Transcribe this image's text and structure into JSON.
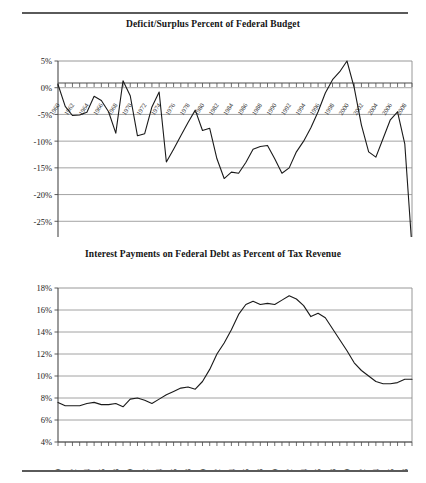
{
  "page": {
    "has_top_rule": true,
    "has_bottom_rule": true,
    "rule_color": "#5a5a5a"
  },
  "chart_data": [
    {
      "id": "deficit-surplus",
      "type": "line",
      "title": "Deficit/Surplus Percent of Federal Budget",
      "xlabel": "",
      "ylabel": "",
      "grid": true,
      "legend": "none",
      "line_color": "#1a1a1a",
      "xlim": [
        1960,
        2009
      ],
      "ylim": [
        -30,
        5
      ],
      "yticks": [
        5,
        0,
        -5,
        -10,
        -15,
        -20,
        -25,
        -30
      ],
      "ytick_labels": [
        "5%",
        "0%",
        "-5%",
        "-10%",
        "-15%",
        "-20%",
        "-25%",
        "-30%"
      ],
      "xticks": [
        1960,
        1962,
        1964,
        1966,
        1968,
        1970,
        1972,
        1974,
        1976,
        1978,
        1980,
        1982,
        1984,
        1986,
        1988,
        1990,
        1992,
        1994,
        1996,
        1998,
        2000,
        2002,
        2004,
        2006,
        2008
      ],
      "xtick_labels": [
        "1960",
        "1962",
        "1964",
        "1966",
        "1968",
        "1970",
        "1972",
        "1974",
        "1976",
        "1978",
        "1980",
        "1982",
        "1984",
        "1986",
        "1988",
        "1990",
        "1992",
        "1994",
        "1996",
        "1998",
        "2000",
        "2002",
        "2004",
        "2006",
        "2008"
      ],
      "x": [
        1960,
        1961,
        1962,
        1963,
        1964,
        1965,
        1966,
        1967,
        1968,
        1969,
        1970,
        1971,
        1972,
        1973,
        1974,
        1975,
        1976,
        1977,
        1978,
        1979,
        1980,
        1981,
        1982,
        1983,
        1984,
        1985,
        1986,
        1987,
        1988,
        1989,
        1990,
        1991,
        1992,
        1993,
        1994,
        1995,
        1996,
        1997,
        1998,
        1999,
        2000,
        2001,
        2002,
        2003,
        2004,
        2005,
        2006,
        2007,
        2008,
        2009
      ],
      "values": [
        0.6,
        -3.5,
        -5.2,
        -5.1,
        -4.6,
        -1.6,
        -2.4,
        -4.5,
        -8.5,
        1.3,
        -1.5,
        -9.0,
        -8.6,
        -3.6,
        -0.8,
        -13.9,
        -11.5,
        -9.0,
        -6.5,
        -4.2,
        -8.0,
        -7.6,
        -13.3,
        -17.0,
        -15.8,
        -16.0,
        -14.0,
        -11.5,
        -11.0,
        -10.8,
        -13.3,
        -16.0,
        -15.0,
        -12.0,
        -10.0,
        -7.5,
        -4.5,
        -1.0,
        1.5,
        3.0,
        5.0,
        0.0,
        -7.0,
        -12.0,
        -13.0,
        -9.5,
        -6.0,
        -4.5,
        -10.5,
        -30.0
      ],
      "series": [
        {
          "name": "Deficit/Surplus Percent of Federal Budget",
          "values": [
            0.6,
            -3.5,
            -5.2,
            -5.1,
            -4.6,
            -1.6,
            -2.4,
            -4.5,
            -8.5,
            1.3,
            -1.5,
            -9.0,
            -8.6,
            -3.6,
            -0.8,
            -13.9,
            -11.5,
            -9.0,
            -6.5,
            -4.2,
            -8.0,
            -7.6,
            -13.3,
            -17.0,
            -15.8,
            -16.0,
            -14.0,
            -11.5,
            -11.0,
            -10.8,
            -13.3,
            -16.0,
            -15.0,
            -12.0,
            -10.0,
            -7.5,
            -4.5,
            -1.0,
            1.5,
            3.0,
            5.0,
            0.0,
            -7.0,
            -12.0,
            -13.0,
            -9.5,
            -6.0,
            -4.5,
            -10.5,
            -30.0
          ]
        }
      ]
    },
    {
      "id": "interest-payments",
      "type": "line",
      "title": "Interest Payments on Federal Debt as Percent of Tax Revenue",
      "xlabel": "",
      "ylabel": "",
      "grid": true,
      "legend": "none",
      "line_color": "#1a1a1a",
      "xlim": [
        1960,
        2009
      ],
      "ylim": [
        4,
        18
      ],
      "yticks": [
        18,
        16,
        14,
        12,
        10,
        8,
        6,
        4
      ],
      "ytick_labels": [
        "18%",
        "16%",
        "14%",
        "12%",
        "10%",
        "8%",
        "6%",
        "4%"
      ],
      "xticks": [
        1960,
        1962,
        1964,
        1966,
        1968,
        1970,
        1972,
        1974,
        1976,
        1978,
        1980,
        1982,
        1984,
        1986,
        1988,
        1990,
        1992,
        1994,
        1996,
        1998,
        2000,
        2002,
        2004,
        2006,
        2008
      ],
      "xtick_labels": [
        "1960",
        "1962",
        "1964",
        "1966",
        "1968",
        "1970",
        "1972",
        "1974",
        "1976",
        "1978",
        "1980",
        "1982",
        "1984",
        "1986",
        "1988",
        "1990",
        "1992",
        "1994",
        "1996",
        "1998",
        "2000",
        "2002",
        "2004",
        "2006",
        "2008"
      ],
      "x": [
        1960,
        1961,
        1962,
        1963,
        1964,
        1965,
        1966,
        1967,
        1968,
        1969,
        1970,
        1971,
        1972,
        1973,
        1974,
        1975,
        1976,
        1977,
        1978,
        1979,
        1980,
        1981,
        1982,
        1983,
        1984,
        1985,
        1986,
        1987,
        1988,
        1989,
        1990,
        1991,
        1992,
        1993,
        1994,
        1995,
        1996,
        1997,
        1998,
        1999,
        2000,
        2001,
        2002,
        2003,
        2004,
        2005,
        2006,
        2007,
        2008,
        2009
      ],
      "values": [
        7.6,
        7.3,
        7.3,
        7.3,
        7.5,
        7.6,
        7.4,
        7.4,
        7.5,
        7.2,
        7.9,
        8.0,
        7.8,
        7.5,
        7.9,
        8.3,
        8.6,
        8.9,
        9.0,
        8.8,
        9.5,
        10.6,
        12.0,
        13.0,
        14.2,
        15.6,
        16.5,
        16.8,
        16.5,
        16.6,
        16.5,
        16.9,
        17.3,
        17.0,
        16.4,
        15.4,
        15.7,
        15.3,
        14.3,
        13.3,
        12.3,
        11.2,
        10.5,
        10.0,
        9.5,
        9.3,
        9.3,
        9.4,
        9.7,
        9.7
      ],
      "series": [
        {
          "name": "Interest Payments on Federal Debt as Percent of Tax Revenue",
          "values": [
            7.6,
            7.3,
            7.3,
            7.3,
            7.5,
            7.6,
            7.4,
            7.4,
            7.5,
            7.2,
            7.9,
            8.0,
            7.8,
            7.5,
            7.9,
            8.3,
            8.6,
            8.9,
            9.0,
            8.8,
            9.5,
            10.6,
            12.0,
            13.0,
            14.2,
            15.6,
            16.5,
            16.8,
            16.5,
            16.6,
            16.5,
            16.9,
            17.3,
            17.0,
            16.4,
            15.4,
            15.7,
            15.3,
            14.3,
            13.3,
            12.3,
            11.2,
            10.5,
            10.0,
            9.5,
            9.3,
            9.3,
            9.4,
            9.7,
            9.7
          ]
        }
      ]
    }
  ]
}
